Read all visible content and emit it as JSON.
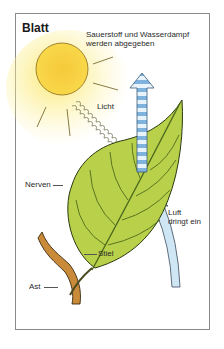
{
  "title": "Blatt",
  "labels": {
    "output": [
      "Sauerstoff und Wasserdampf",
      "werden abgegeben"
    ],
    "light": "Licht",
    "veins": "Nerven",
    "air": [
      "Luft",
      "dringt ein"
    ],
    "stalk": "Stiel",
    "branch": "Ast"
  },
  "colors": {
    "sun": "#f7d43a",
    "sun_glow": "#fbe86a",
    "leaf": "#b8d04a",
    "leaf_dark": "#4f6a1c",
    "arrow_out": "#8fc0e6",
    "arrow_in": "#cfe6f4",
    "branch": "#c98a3a"
  }
}
